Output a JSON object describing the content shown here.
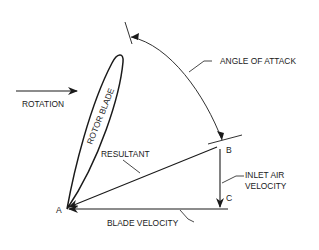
{
  "diagram": {
    "labels": {
      "rotation": "ROTATION",
      "rotor_blade": "ROTOR BLADE",
      "angle_of_attack": "ANGLE OF ATTACK",
      "resultant": "RESULTANT",
      "inlet_air_line1": "INLET AIR",
      "inlet_air_line2": "VELOCITY",
      "blade_velocity": "BLADE VELOCITY"
    },
    "points": {
      "a": "A",
      "b": "B",
      "c": "C"
    },
    "colors": {
      "line": "#1a1a1a",
      "background": "#ffffff"
    }
  }
}
